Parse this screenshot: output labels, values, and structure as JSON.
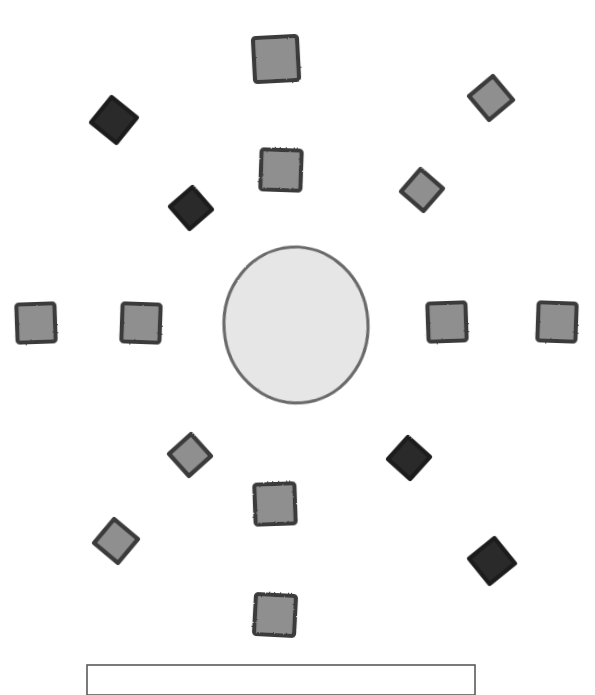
{
  "figure": {
    "title": "Radial arrangement of square and diamond markers around a central ellipse",
    "width": 595,
    "height": 695,
    "background_color": "#ffffff",
    "style": "hand-drawn scanned line art, grayscale"
  },
  "palette": {
    "dark_marker_fill": "#2b2b2b",
    "dark_marker_stroke": "#1a1a1a",
    "gray_marker_fill": "#8f8f8f",
    "gray_marker_stroke": "#3b3b3b",
    "center_fill": "#e6e6e6",
    "center_stroke": "#6b6b6b",
    "caption_stroke": "#5a5a5a",
    "background": "#ffffff"
  },
  "center": {
    "name": "central-ellipse",
    "shape": "ellipse",
    "cx": 296,
    "cy": 325,
    "rx": 72,
    "ry": 78,
    "fill": "#e6e6e6",
    "stroke": "#6b6b6b",
    "stroke_width": 3.2,
    "rotation": -4
  },
  "chart_data": {
    "type": "scatter",
    "title": "Radial arrangement of square and diamond markers around a central ellipse",
    "xlabel": "",
    "ylabel": "",
    "xlim": [
      0,
      595
    ],
    "ylim": [
      0,
      695
    ],
    "grid": false,
    "legend": "none",
    "note": "Marker coordinates are in image pixel space, origin at top-left.",
    "series": [
      {
        "name": "gray-squares",
        "marker": "square",
        "fill": "#8f8f8f",
        "stroke": "#3b3b3b",
        "points": [
          {
            "id": "sq-top-outer",
            "x": 276,
            "y": 59,
            "size": 44,
            "rotation": -3
          },
          {
            "id": "sq-top-inner",
            "x": 281,
            "y": 170,
            "size": 40,
            "rotation": 2
          },
          {
            "id": "sq-left-outer",
            "x": 36,
            "y": 323,
            "size": 38,
            "rotation": -2
          },
          {
            "id": "sq-left-inner",
            "x": 141,
            "y": 323,
            "size": 38,
            "rotation": 2
          },
          {
            "id": "sq-right-inner",
            "x": 447,
            "y": 322,
            "size": 38,
            "rotation": -2
          },
          {
            "id": "sq-right-outer",
            "x": 557,
            "y": 322,
            "size": 38,
            "rotation": 2
          },
          {
            "id": "sq-bottom-inner",
            "x": 275,
            "y": 504,
            "size": 40,
            "rotation": -2
          },
          {
            "id": "sq-bottom-outer",
            "x": 275,
            "y": 615,
            "size": 40,
            "rotation": 3
          }
        ]
      },
      {
        "name": "gray-diamonds",
        "marker": "diamond",
        "fill": "#8f8f8f",
        "stroke": "#3b3b3b",
        "points": [
          {
            "id": "dia-ne-outer",
            "x": 491,
            "y": 98,
            "size": 44,
            "rotation": 5
          },
          {
            "id": "dia-ne-inner",
            "x": 422,
            "y": 190,
            "size": 42,
            "rotation": -4
          },
          {
            "id": "dia-sw-inner",
            "x": 190,
            "y": 455,
            "size": 42,
            "rotation": 3
          },
          {
            "id": "dia-sw-outer",
            "x": 116,
            "y": 541,
            "size": 44,
            "rotation": -5
          }
        ]
      },
      {
        "name": "dark-diamonds",
        "marker": "diamond",
        "fill": "#2b2b2b",
        "stroke": "#1a1a1a",
        "points": [
          {
            "id": "dia-nw-outer",
            "x": 114,
            "y": 120,
            "size": 46,
            "rotation": -6
          },
          {
            "id": "dia-nw-inner",
            "x": 191,
            "y": 208,
            "size": 42,
            "rotation": 4
          },
          {
            "id": "dia-se-inner",
            "x": 409,
            "y": 458,
            "size": 42,
            "rotation": -3
          },
          {
            "id": "dia-se-outer",
            "x": 492,
            "y": 561,
            "size": 46,
            "rotation": 6
          }
        ]
      }
    ]
  },
  "caption_box": {
    "name": "caption-frame",
    "x": 87,
    "y": 665,
    "width": 388,
    "height": 30,
    "stroke": "#5a5a5a",
    "stroke_width": 1.6,
    "fill": "none",
    "clipped_at_bottom": true
  }
}
